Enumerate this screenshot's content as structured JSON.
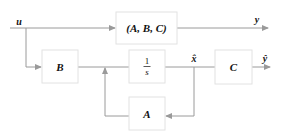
{
  "diagram": {
    "input_label": "u",
    "output_label": "y",
    "estimate_state_label": "x̂",
    "estimate_output_label": "ŷ",
    "blocks": {
      "plant": {
        "label": "(A, B, C)"
      },
      "input_matrix": {
        "label": "B"
      },
      "integrator": {
        "numerator": "1",
        "denominator": "s"
      },
      "output_matrix": {
        "label": "C"
      },
      "state_matrix": {
        "label": "A"
      }
    },
    "colors": {
      "line": "#9a9a9a",
      "box_border": "#e2e2e2",
      "text": "#111111"
    }
  }
}
